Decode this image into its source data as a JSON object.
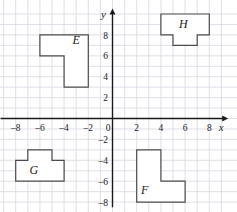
{
  "chart_data": {
    "type": "scatter",
    "title": "",
    "xlabel": "x",
    "ylabel": "y",
    "xlim": [
      -9.2,
      9.4
    ],
    "ylim": [
      -8.6,
      10.3
    ],
    "grid": true,
    "legend_position": "none",
    "x_ticks": [
      -8,
      -6,
      -4,
      -2,
      0,
      2,
      4,
      6,
      8
    ],
    "x_tick_labels": [
      "–8",
      "–6",
      "–4",
      "–2",
      "0",
      "2",
      "4",
      "6",
      "8"
    ],
    "y_ticks": [
      8,
      6,
      4,
      2,
      -2,
      -4,
      -6,
      -8
    ],
    "y_tick_labels": [
      "8",
      "6",
      "4",
      "2",
      "–2",
      "–4",
      "–6",
      "–8"
    ],
    "origin_label": "0",
    "grid_step": 1,
    "shapes": [
      {
        "name": "E",
        "label": "E",
        "label_position": [
          -3.0,
          7.1
        ],
        "vertices": [
          [
            -6,
            8
          ],
          [
            -2,
            8
          ],
          [
            -2,
            3
          ],
          [
            -4,
            3
          ],
          [
            -4,
            6
          ],
          [
            -6,
            6
          ]
        ],
        "quadrant": "upper-left"
      },
      {
        "name": "H",
        "label": "H",
        "label_position": [
          5.85,
          8.7
        ],
        "vertices": [
          [
            4,
            10
          ],
          [
            8,
            10
          ],
          [
            8,
            8
          ],
          [
            7,
            8
          ],
          [
            7,
            7
          ],
          [
            5,
            7
          ],
          [
            5,
            8
          ],
          [
            4,
            8
          ]
        ],
        "quadrant": "upper-right"
      },
      {
        "name": "G",
        "label": "G",
        "label_position": [
          -6.5,
          -5.3
        ],
        "vertices": [
          [
            -8,
            -4
          ],
          [
            -7,
            -4
          ],
          [
            -7,
            -3
          ],
          [
            -5,
            -3
          ],
          [
            -5,
            -4
          ],
          [
            -4,
            -4
          ],
          [
            -4,
            -6
          ],
          [
            -8,
            -6
          ]
        ],
        "quadrant": "lower-left"
      },
      {
        "name": "F",
        "label": "F",
        "label_position": [
          2.65,
          -7.2
        ],
        "vertices": [
          [
            2,
            -3
          ],
          [
            4,
            -3
          ],
          [
            4,
            -6
          ],
          [
            6,
            -6
          ],
          [
            6,
            -8
          ],
          [
            2,
            -8
          ]
        ],
        "quadrant": "lower-right"
      }
    ]
  },
  "colors": {
    "grid": "#d8d8e2",
    "axis": "#1a1a1a",
    "shape_stroke": "#4a4a4a",
    "shape_fill": "#ffffff",
    "background": "#ffffff",
    "text": "#1a1a1a"
  }
}
